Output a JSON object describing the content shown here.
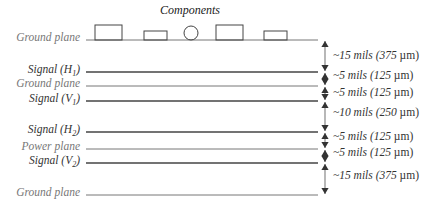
{
  "title": "Components",
  "layers": [
    {
      "label": "Ground plane",
      "y": 40,
      "style": "light",
      "color": "#777777"
    },
    {
      "label": "Signal (H",
      "sub": "1",
      "suffix": ")",
      "y": 72,
      "style": "dark",
      "color": "#444444"
    },
    {
      "label": "Ground plane",
      "y": 86,
      "style": "light",
      "color": "#777777"
    },
    {
      "label": "Signal (V",
      "sub": "1",
      "suffix": ")",
      "y": 101,
      "style": "dark",
      "color": "#444444"
    },
    {
      "label": "Signal (H",
      "sub": "2",
      "suffix": ")",
      "y": 132,
      "style": "dark",
      "color": "#444444"
    },
    {
      "label": "Power plane",
      "y": 149,
      "style": "light",
      "color": "#777777"
    },
    {
      "label": "Signal (V",
      "sub": "2",
      "suffix": ")",
      "y": 163,
      "style": "dark",
      "color": "#444444"
    },
    {
      "label": "Ground plane",
      "y": 195,
      "style": "light",
      "color": "#777777"
    }
  ],
  "dimensions": [
    {
      "text": "~15 mils (375 ",
      "unit": "µm)",
      "from": 40,
      "to": 72,
      "label_y": 49
    },
    {
      "text": "~5 mils (125 ",
      "unit": "µm)",
      "from": 72,
      "to": 86,
      "label_y": 69
    },
    {
      "text": "~5 mils (125 ",
      "unit": "µm)",
      "from": 86,
      "to": 101,
      "label_y": 86
    },
    {
      "text": "~10 mils (250 ",
      "unit": "µm)",
      "from": 101,
      "to": 132,
      "label_y": 106
    },
    {
      "text": "~5 mils (125 ",
      "unit": "µm)",
      "from": 132,
      "to": 149,
      "label_y": 130
    },
    {
      "text": "~5 mils (125 ",
      "unit": "µm)",
      "from": 149,
      "to": 163,
      "label_y": 146
    },
    {
      "text": "~15 mils (375 ",
      "unit": "µm)",
      "from": 163,
      "to": 195,
      "label_y": 169
    }
  ],
  "components": [
    {
      "shape": "rect",
      "x": 95,
      "y": 25,
      "w": 27,
      "h": 15
    },
    {
      "shape": "rect",
      "x": 144,
      "y": 31,
      "w": 23,
      "h": 9
    },
    {
      "shape": "circle",
      "cx": 191,
      "cy": 33,
      "r": 7
    },
    {
      "shape": "rect",
      "x": 216,
      "y": 25,
      "w": 27,
      "h": 15
    },
    {
      "shape": "rect",
      "x": 264,
      "y": 31,
      "w": 23,
      "h": 9
    }
  ]
}
